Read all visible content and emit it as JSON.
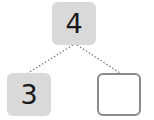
{
  "diagram": {
    "type": "number-bond",
    "whole": {
      "value": "4",
      "fill": "#d9d9d9"
    },
    "parts": [
      {
        "value": "3",
        "fill": "#d9d9d9",
        "empty": false
      },
      {
        "value": "",
        "fill": "#ffffff",
        "border": "#8a8a8a",
        "empty": true
      }
    ],
    "connector_style": "dotted",
    "connector_color": "#777777"
  }
}
